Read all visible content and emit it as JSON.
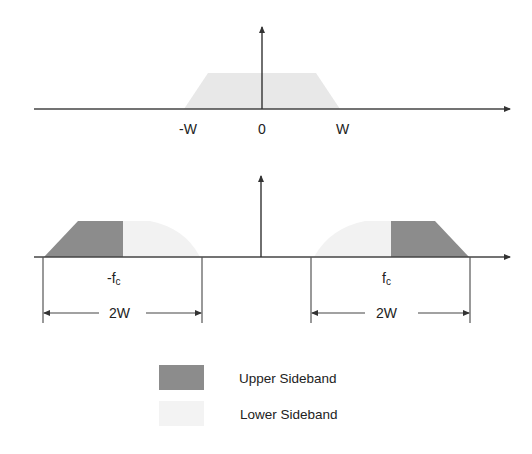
{
  "colors": {
    "upper_sideband": "#8c8c8c",
    "lower_sideband": "#f0f0f0",
    "baseband": "#e6e6e6",
    "axis": "#333333"
  },
  "top_plot": {
    "labels": {
      "neg_w": "-W",
      "zero": "0",
      "pos_w": "W"
    }
  },
  "bottom_plot": {
    "labels": {
      "neg_fc_prefix": "-f",
      "neg_fc_sub": "c",
      "pos_fc_prefix": "f",
      "pos_fc_sub": "c",
      "left_bandwidth": "2W",
      "right_bandwidth": "2W"
    }
  },
  "legend": {
    "items": [
      {
        "label": "Upper Sideband"
      },
      {
        "label": "Lower Sideband"
      }
    ]
  }
}
